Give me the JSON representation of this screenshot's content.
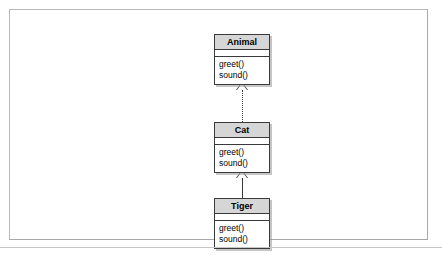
{
  "diagram": {
    "type": "uml-class-diagram",
    "frame": {
      "border_color": "#b9b9b9",
      "background": "#ffffff"
    },
    "classes": [
      {
        "id": "animal",
        "name": "Animal",
        "attributes": [],
        "methods": [
          "greet()",
          "sound()"
        ]
      },
      {
        "id": "cat",
        "name": "Cat",
        "attributes": [],
        "methods": [
          "greet()",
          "sound()"
        ]
      },
      {
        "id": "tiger",
        "name": "Tiger",
        "attributes": [],
        "methods": [
          "greet()",
          "sound()"
        ]
      }
    ],
    "relationships": [
      {
        "id": "cat-animal",
        "from": "Cat",
        "to": "Animal",
        "kind": "realization",
        "line_style": "dotted",
        "arrowhead": "hollow-triangle"
      },
      {
        "id": "tiger-cat",
        "from": "Tiger",
        "to": "Cat",
        "kind": "generalization",
        "line_style": "solid",
        "arrowhead": "hollow-triangle"
      }
    ],
    "colors": {
      "class_border": "#3a3a3a",
      "title_fill": "#d6d6d6",
      "body_fill": "#ffffff",
      "connector": "#3a3a3a",
      "shadow": "#969696"
    }
  }
}
